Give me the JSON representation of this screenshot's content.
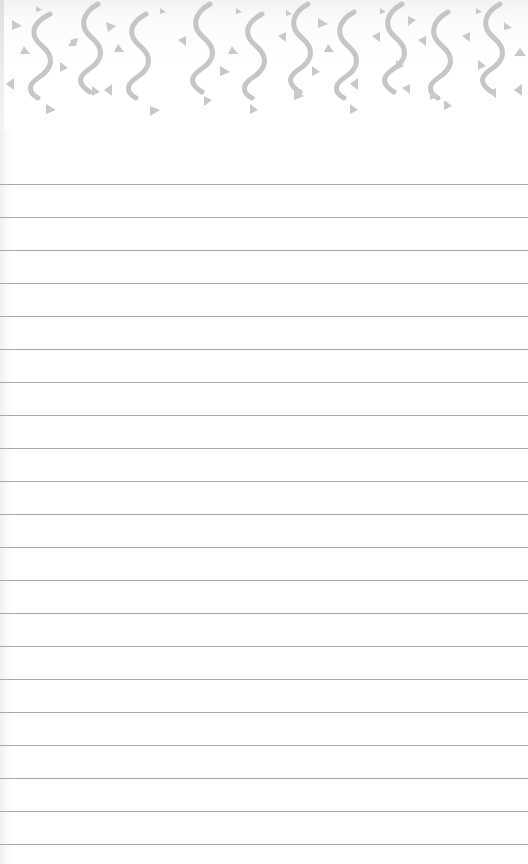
{
  "notepad": {
    "header": {
      "pattern": "confetti-squiggles-and-triangles",
      "color": "#c9c9c9",
      "squiggle_count": 10
    },
    "lines": {
      "count": 21,
      "first_y": 184,
      "spacing": 33,
      "color": "#a9a9a9"
    },
    "background": "#ffffff"
  }
}
